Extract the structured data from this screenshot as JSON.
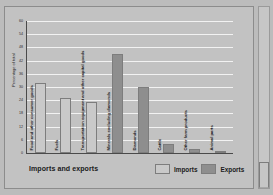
{
  "figure": {
    "x_axis_title": "Imports and exports",
    "y_axis_title": "Percentage of total"
  },
  "legend": {
    "items": [
      {
        "label": "Imports",
        "color": "#c9c9c9"
      },
      {
        "label": "Exports",
        "color": "#8e8e8e"
      }
    ]
  },
  "chart_data": {
    "type": "bar",
    "title": "",
    "xlabel": "Imports and exports",
    "ylabel": "Percentage of total",
    "ylim": [
      0,
      60
    ],
    "yticks": [
      0,
      6,
      12,
      18,
      24,
      30,
      36,
      42,
      48,
      54,
      60
    ],
    "grid": true,
    "legend_position": "bottom-right",
    "categories": [
      "Food and other consumer goods",
      "Fuels",
      "Transportation equipment and other capital goods",
      "Minerals excluding diamonds",
      "Diamonds",
      "Cattle",
      "Other farm products",
      "Animal parts"
    ],
    "series": [
      {
        "name": "Imports",
        "color": "#c9c9c9",
        "values": [
          32,
          25,
          23,
          null,
          null,
          null,
          null,
          null
        ]
      },
      {
        "name": "Exports",
        "color": "#8e8e8e",
        "values": [
          null,
          null,
          null,
          45,
          30,
          4,
          2,
          1
        ]
      }
    ],
    "bars": [
      {
        "category": "Food and other consumer goods",
        "series": "Imports",
        "value": 32
      },
      {
        "category": "Fuels",
        "series": "Imports",
        "value": 25
      },
      {
        "category": "Transportation equipment and other capital goods",
        "series": "Imports",
        "value": 23
      },
      {
        "category": "Minerals excluding diamonds",
        "series": "Exports",
        "value": 45
      },
      {
        "category": "Diamonds",
        "series": "Exports",
        "value": 30
      },
      {
        "category": "Cattle",
        "series": "Exports",
        "value": 4
      },
      {
        "category": "Other farm products",
        "series": "Exports",
        "value": 2
      },
      {
        "category": "Animal parts",
        "series": "Exports",
        "value": 1
      }
    ]
  }
}
